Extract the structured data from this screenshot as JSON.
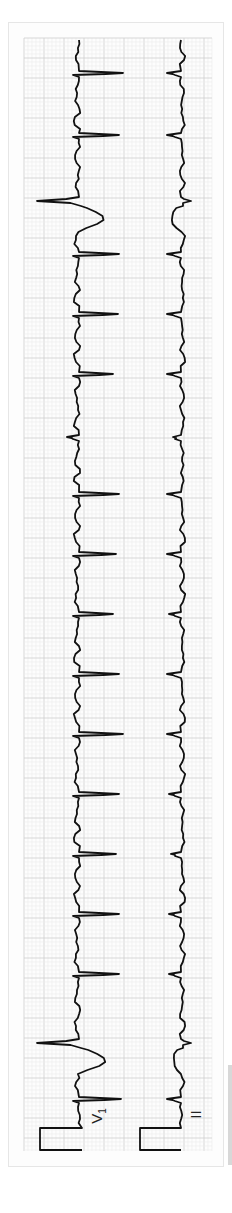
{
  "chart_data": {
    "type": "line",
    "title": "",
    "orientation": "rotated-90-ccw",
    "grid": {
      "on": true,
      "small_px": 4,
      "large_px": 20,
      "x0": 24,
      "y0": 38,
      "x1": 212,
      "y1": 1151,
      "minor_color": "#ececec",
      "major_color": "#d2d2d2"
    },
    "paper": {
      "color": "#ffffff"
    },
    "trace_color": "#111111",
    "leads": [
      {
        "name": "V1",
        "label_main": "V",
        "label_sub": "1",
        "baseline_x": 79,
        "calibration": {
          "x0": 40,
          "x1": 82,
          "y0": 1128,
          "y1": 1150
        },
        "beats": [
          {
            "y": 74,
            "type": "normal",
            "amp": 44
          },
          {
            "y": 136,
            "type": "normal",
            "amp": 40
          },
          {
            "y": 201,
            "type": "pvc",
            "amp": -42,
            "t_amp": 24
          },
          {
            "y": 255,
            "type": "normal",
            "amp": 40
          },
          {
            "y": 315,
            "type": "normal",
            "amp": 39
          },
          {
            "y": 375,
            "type": "normal",
            "amp": 34
          },
          {
            "y": 438,
            "type": "pac",
            "amp": -12
          },
          {
            "y": 495,
            "type": "normal",
            "amp": 40
          },
          {
            "y": 555,
            "type": "normal",
            "amp": 37
          },
          {
            "y": 615,
            "type": "normal",
            "amp": 34
          },
          {
            "y": 675,
            "type": "normal",
            "amp": 40
          },
          {
            "y": 735,
            "type": "normal",
            "amp": 44
          },
          {
            "y": 795,
            "type": "normal",
            "amp": 40
          },
          {
            "y": 855,
            "type": "normal",
            "amp": 37
          },
          {
            "y": 915,
            "type": "normal",
            "amp": 40
          },
          {
            "y": 975,
            "type": "normal",
            "amp": 40
          },
          {
            "y": 1043,
            "type": "pvc",
            "amp": -42,
            "t_amp": 26
          },
          {
            "y": 1100,
            "type": "normal",
            "amp": 42
          }
        ]
      },
      {
        "name": "II",
        "label_main": "II",
        "label_sub": "",
        "baseline_x": 181,
        "calibration": {
          "x0": 140,
          "x1": 181,
          "y0": 1128,
          "y1": 1150
        },
        "beats": [
          {
            "y": 74,
            "type": "normal",
            "amp": -14
          },
          {
            "y": 136,
            "type": "normal",
            "amp": -14
          },
          {
            "y": 201,
            "type": "pvc",
            "amp": 10,
            "t_amp": -10
          },
          {
            "y": 255,
            "type": "normal",
            "amp": -14
          },
          {
            "y": 315,
            "type": "normal",
            "amp": -14
          },
          {
            "y": 375,
            "type": "normal",
            "amp": -14
          },
          {
            "y": 438,
            "type": "pac",
            "amp": -8
          },
          {
            "y": 495,
            "type": "normal",
            "amp": -14
          },
          {
            "y": 555,
            "type": "normal",
            "amp": -14
          },
          {
            "y": 615,
            "type": "normal",
            "amp": -12
          },
          {
            "y": 675,
            "type": "normal",
            "amp": -14
          },
          {
            "y": 735,
            "type": "normal",
            "amp": -14
          },
          {
            "y": 795,
            "type": "normal",
            "amp": -12
          },
          {
            "y": 855,
            "type": "normal",
            "amp": -10
          },
          {
            "y": 915,
            "type": "normal",
            "amp": -12
          },
          {
            "y": 975,
            "type": "normal",
            "amp": -12
          },
          {
            "y": 1043,
            "type": "pvc",
            "amp": 10,
            "t_amp": -8
          },
          {
            "y": 1100,
            "type": "normal",
            "amp": -14
          }
        ]
      }
    ],
    "xlabel": "",
    "ylabel": ""
  }
}
